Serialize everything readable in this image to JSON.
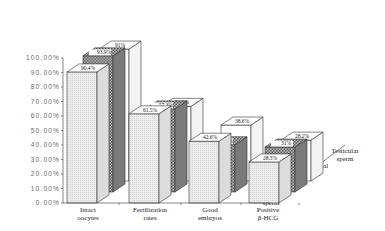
{
  "chart_data": {
    "type": "bar",
    "variant": "3d-grouped-depth",
    "title": "",
    "xlabel": "",
    "ylabel": "",
    "ylim": [
      0,
      100
    ],
    "yticks": [
      "0.00%",
      "10.00%",
      "20.00%",
      "30.00%",
      "40.00%",
      "50.00%",
      "60.00%",
      "70.00%",
      "80.00%",
      "90.00%",
      "100.00%"
    ],
    "categories": [
      "Intact oocytes",
      "Fertilization rates",
      "Good embryos",
      "Positive β-HCG"
    ],
    "category_lines": [
      [
        "Intact",
        "oocytes"
      ],
      [
        "Fertilization",
        "rates"
      ],
      [
        "Good",
        "embryos"
      ],
      [
        "Positive",
        "β-HCG"
      ]
    ],
    "series": [
      {
        "name": "Ejaculated sperm",
        "name_lines": [
          "Ejaculated",
          "sperm"
        ],
        "values": [
          90.4,
          61.5,
          42.6,
          28.3
        ],
        "labels": [
          "90.4%",
          "61.5%",
          "42.6%",
          "28.3%"
        ],
        "fill": "#e8e8e8"
      },
      {
        "name": "Epididymal sperm",
        "name_lines": [
          "Epididymal",
          "sperm"
        ],
        "values": [
          93.9,
          57.3,
          32.6,
          31
        ],
        "labels": [
          "93.9%",
          "57.3%",
          "32.6%",
          "31%"
        ],
        "fill": "#9a9a9a"
      },
      {
        "name": "Testicular sperm",
        "name_lines": [
          "Testicular",
          "sperm"
        ],
        "values": [
          91,
          51.5,
          38.6,
          28.2
        ],
        "labels": [
          "91%",
          "51.5%",
          "38.6%",
          "28.2%"
        ],
        "fill": "#ffffff"
      }
    ],
    "grid": false,
    "legend_position": "depth-axis-right"
  }
}
